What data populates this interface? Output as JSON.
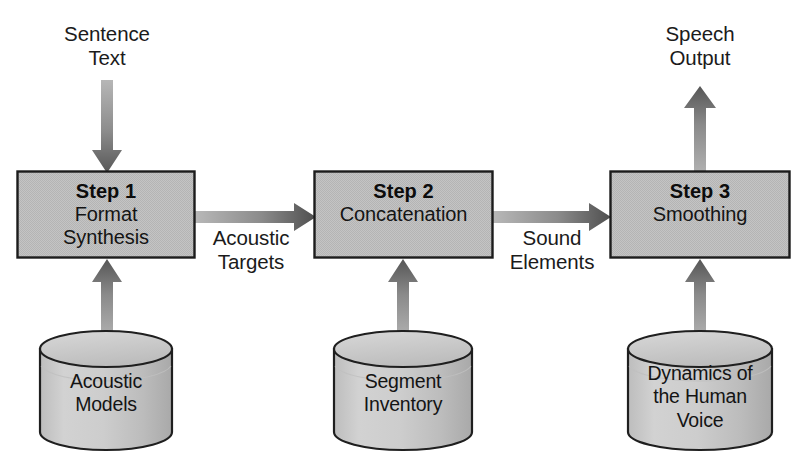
{
  "diagram": {
    "type": "flow-diagram",
    "background_color": "#ffffff",
    "box_fill_color": "#c2c2c2",
    "box_border_color": "#1a1a1a",
    "cylinder_fill_color": "#c6c6c6",
    "arrow_color": "#6e6e6e",
    "text_color": "#141414"
  },
  "inputs": [
    {
      "id": "sentence-text",
      "label": "Sentence\nText"
    }
  ],
  "outputs": [
    {
      "id": "speech-output",
      "label": "Speech\nOutput"
    }
  ],
  "steps": [
    {
      "id": "step-1",
      "title": "Step 1",
      "subtitle": "Format\nSynthesis"
    },
    {
      "id": "step-2",
      "title": "Step 2",
      "subtitle": "Concatenation"
    },
    {
      "id": "step-3",
      "title": "Step 3",
      "subtitle": "Smoothing"
    }
  ],
  "edge_labels": [
    {
      "id": "acoustic-targets",
      "label": "Acoustic\nTargets"
    },
    {
      "id": "sound-elements",
      "label": "Sound\nElements"
    }
  ],
  "datastores": [
    {
      "id": "acoustic-models",
      "label": "Acoustic\nModels"
    },
    {
      "id": "segment-inventory",
      "label": "Segment\nInventory"
    },
    {
      "id": "dynamics-human-voice",
      "label": "Dynamics of\nthe Human\nVoice"
    }
  ]
}
